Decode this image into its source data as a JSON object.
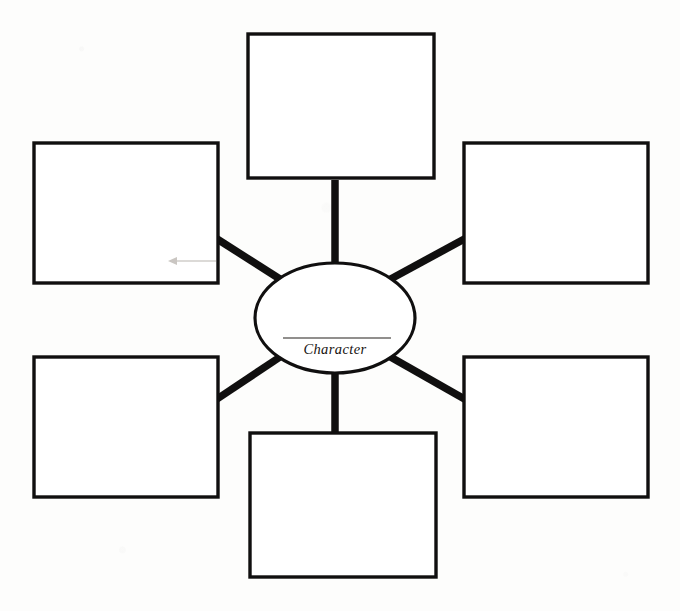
{
  "document": {
    "type": "graphic-organizer",
    "title": "Character Web",
    "background_color": "#fdfdfc",
    "ink_color": "#100f0f"
  },
  "center": {
    "shape": "ellipse",
    "label": "Character",
    "label_style": "italic-serif",
    "has_write_on_rule": true,
    "cx": 335,
    "cy": 318,
    "rx": 80,
    "ry": 55
  },
  "boxes": [
    {
      "id": "top",
      "name": "trait-box-top",
      "label": "",
      "x": 248,
      "y": 34,
      "width": 186,
      "height": 144
    },
    {
      "id": "top-left",
      "name": "trait-box-top-left",
      "label": "",
      "x": 34,
      "y": 143,
      "width": 184,
      "height": 140
    },
    {
      "id": "top-right",
      "name": "trait-box-top-right",
      "label": "",
      "x": 464,
      "y": 143,
      "width": 184,
      "height": 140
    },
    {
      "id": "bottom-left",
      "name": "trait-box-bottom-left",
      "label": "",
      "x": 34,
      "y": 357,
      "width": 184,
      "height": 140
    },
    {
      "id": "bottom-right",
      "name": "trait-box-bottom-right",
      "label": "",
      "x": 464,
      "y": 357,
      "width": 184,
      "height": 140
    },
    {
      "id": "bottom",
      "name": "trait-box-bottom",
      "label": "",
      "x": 250,
      "y": 433,
      "width": 186,
      "height": 144
    }
  ],
  "connectors": [
    {
      "id": "to-top",
      "from": "center",
      "to": "top",
      "orientation": "vertical",
      "x1": 335,
      "y1": 265,
      "x2": 335,
      "y2": 178
    },
    {
      "id": "to-bottom",
      "from": "center",
      "to": "bottom",
      "orientation": "vertical",
      "x1": 335,
      "y1": 371,
      "x2": 335,
      "y2": 433
    },
    {
      "id": "to-top-left",
      "from": "center",
      "to": "top-left",
      "orientation": "diagonal",
      "x1": 281,
      "y1": 280,
      "x2": 216,
      "y2": 239
    },
    {
      "id": "to-top-right",
      "from": "center",
      "to": "top-right",
      "orientation": "diagonal",
      "x1": 389,
      "y1": 280,
      "x2": 466,
      "y2": 239
    },
    {
      "id": "to-bottom-left",
      "from": "center",
      "to": "bottom-left",
      "orientation": "diagonal",
      "x1": 281,
      "y1": 356,
      "x2": 216,
      "y2": 400
    },
    {
      "id": "to-bottom-right",
      "from": "center",
      "to": "bottom-right",
      "orientation": "diagonal",
      "x1": 389,
      "y1": 356,
      "x2": 466,
      "y2": 400
    }
  ],
  "artifacts": [
    {
      "id": "scan-arrow",
      "name": "scan-artifact-arrow",
      "description": "faint gray left-pointing arrow",
      "x": 168,
      "y": 261,
      "width": 48
    }
  ]
}
